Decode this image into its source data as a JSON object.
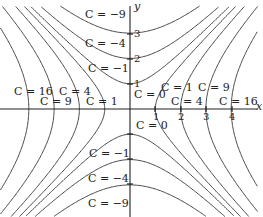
{
  "chart_data": {
    "type": "line",
    "title": "",
    "xlabel": "x",
    "ylabel": "y",
    "xlim": [
      -5.2,
      5.3
    ],
    "ylim": [
      -4.3,
      4.4
    ],
    "grid": false,
    "x_ticks": [
      "1",
      "2",
      "3",
      "4"
    ],
    "y_ticks": [
      "1",
      "2",
      "3"
    ],
    "levels": [
      -9,
      -4,
      -1,
      0,
      1,
      4,
      9,
      16
    ],
    "labels": [
      {
        "text": "C = -9",
        "x": 0,
        "y": 4
      },
      {
        "text": "C = -4",
        "x": 0,
        "y": 3
      },
      {
        "text": "C = -1",
        "x": 0,
        "y": 1.9
      },
      {
        "text": "C = 0",
        "x": 0.5,
        "y": 0.6
      },
      {
        "text": "C = 1",
        "x": 1.6,
        "y": 0.55
      },
      {
        "text": "C = 9",
        "x": 3.3,
        "y": 0.55
      },
      {
        "text": "C = 4",
        "x": 2.5,
        "y": 0.2
      },
      {
        "text": "C = 16",
        "x": 4.2,
        "y": 0.2
      },
      {
        "text": "C = 16",
        "x": -4.3,
        "y": 0.6
      },
      {
        "text": "C = 4",
        "x": -2.2,
        "y": 0.6
      },
      {
        "text": "C = 9",
        "x": -3.3,
        "y": 0.2
      },
      {
        "text": "C = 1",
        "x": -1.3,
        "y": 0.2
      },
      {
        "text": "C = 0",
        "x": 0.6,
        "y": -0.6
      },
      {
        "text": "C = -1",
        "x": 0,
        "y": -1.3
      },
      {
        "text": "C = -4",
        "x": 0,
        "y": -2.3
      },
      {
        "text": "C = -9",
        "x": 0,
        "y": -3.3
      }
    ]
  },
  "labels": {
    "x_axis": "x",
    "y_axis": "y",
    "top_m9": "C = −9",
    "top_m4": "C = −4",
    "top_m1": "C = −1",
    "c0_upper": "C = 0",
    "c0_lower": "C = 0",
    "r_c1": "C = 1",
    "r_c9": "C = 9",
    "r_c4": "C = 4",
    "r_c16": "C = 16",
    "l_c16": "C = 16",
    "l_c4": "C = 4",
    "l_c9": "C = 9",
    "l_c1": "C = 1",
    "bot_m1": "C = −1",
    "bot_m4": "C = −4",
    "bot_m9": "C = −9",
    "xt1": "1",
    "xt2": "2",
    "xt3": "3",
    "xt4": "4",
    "yt1": "1",
    "yt2": "2",
    "yt3": "3"
  }
}
